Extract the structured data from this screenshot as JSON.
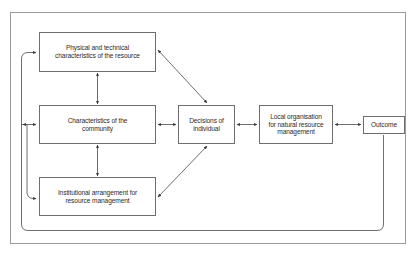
{
  "diagram": {
    "border_color": "#9a9a9a",
    "box_border_color": "#6e6e6e",
    "line_color": "#6e6e6e",
    "text_color": "#2b2b2b",
    "background": "#ffffff",
    "nodes": [
      {
        "id": "physical",
        "label": "Physical and technical\ncharacteristics of the resource",
        "column": "left",
        "row": "top"
      },
      {
        "id": "community",
        "label": "Characteristics of the\ncommunity",
        "column": "left",
        "row": "middle"
      },
      {
        "id": "institutional",
        "label": "Institutional arrangement for\nresource management",
        "column": "left",
        "row": "bottom"
      },
      {
        "id": "decisions",
        "label": "Decisions of\nindividual",
        "column": "center",
        "row": "middle"
      },
      {
        "id": "local_org",
        "label": "Local organisation\nfor natural resource\nmanagement",
        "column": "right",
        "row": "middle"
      },
      {
        "id": "outcome",
        "label": "Outcome",
        "column": "far-right",
        "row": "middle"
      }
    ],
    "connections": [
      {
        "from": "physical",
        "to": "community",
        "type": "bidirectional",
        "style": "vertical"
      },
      {
        "from": "community",
        "to": "institutional",
        "type": "bidirectional",
        "style": "vertical"
      },
      {
        "from": "physical",
        "to": "decisions",
        "type": "bidirectional",
        "style": "diagonal"
      },
      {
        "from": "institutional",
        "to": "decisions",
        "type": "bidirectional",
        "style": "diagonal"
      },
      {
        "from": "community",
        "to": "decisions",
        "type": "bidirectional",
        "style": "horizontal"
      },
      {
        "from": "decisions",
        "to": "local_org",
        "type": "bidirectional",
        "style": "horizontal"
      },
      {
        "from": "local_org",
        "to": "outcome",
        "type": "bidirectional",
        "style": "horizontal"
      },
      {
        "from": "outcome",
        "to": "physical",
        "type": "feedback",
        "style": "routed-left"
      },
      {
        "from": "outcome",
        "to": "community",
        "type": "feedback",
        "style": "routed-left"
      },
      {
        "from": "outcome",
        "to": "institutional",
        "type": "feedback",
        "style": "routed-left"
      }
    ]
  }
}
